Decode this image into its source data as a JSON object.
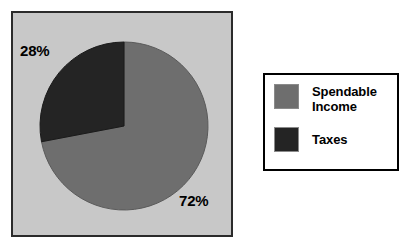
{
  "chart_data": {
    "type": "pie",
    "title": "",
    "categories": [
      "Spendable Income",
      "Taxes"
    ],
    "values": [
      72,
      28
    ],
    "value_unit": "%",
    "data_labels": [
      "72%",
      "28%"
    ],
    "colors": [
      "#6e6e6e",
      "#242424"
    ],
    "start_angle_deg": 0,
    "direction": "counterclockwise",
    "legend_position": "right",
    "grid": false,
    "plot_background": "#c8c8c8",
    "page_background": "#ffffff",
    "border_color": "#2b2b2b",
    "slices": [
      {
        "label": "Spendable Income",
        "value": 72,
        "display": "72%",
        "color": "#6e6e6e"
      },
      {
        "label": "Taxes",
        "value": 28,
        "display": "28%",
        "color": "#242424"
      }
    ]
  },
  "plot": {
    "labels": {
      "taxes_pct": "28%",
      "income_pct": "72%"
    }
  },
  "legend": {
    "entries": [
      {
        "label": "Spendable\nIncome",
        "color": "#6e6e6e"
      },
      {
        "label": "Taxes",
        "color": "#242424"
      }
    ]
  }
}
